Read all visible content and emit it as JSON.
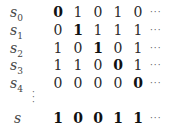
{
  "table": {
    "rows": [
      {
        "label": "s",
        "sub": "0",
        "values": [
          "0",
          "1",
          "0",
          "1",
          "0"
        ],
        "bold_index": 0,
        "ellipsis": "···"
      },
      {
        "label": "s",
        "sub": "1",
        "values": [
          "0",
          "1",
          "1",
          "1",
          "1"
        ],
        "bold_index": 1,
        "ellipsis": "···"
      },
      {
        "label": "s",
        "sub": "2",
        "values": [
          "1",
          "0",
          "1",
          "0",
          "1"
        ],
        "bold_index": 2,
        "ellipsis": "···"
      },
      {
        "label": "s",
        "sub": "3",
        "values": [
          "1",
          "1",
          "0",
          "0",
          "1"
        ],
        "bold_index": 3,
        "ellipsis": "···"
      },
      {
        "label": "s",
        "sub": "4",
        "values": [
          "0",
          "0",
          "0",
          "0",
          "0"
        ],
        "bold_index": 4,
        "ellipsis": "···"
      }
    ],
    "vdots": "⋮",
    "result": {
      "label": "s",
      "values": [
        "1",
        "0",
        "0",
        "1",
        "1"
      ],
      "ellipsis": "···"
    }
  }
}
